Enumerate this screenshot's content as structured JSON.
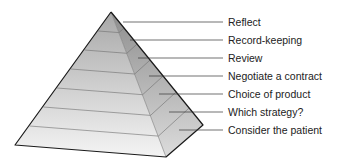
{
  "diagram": {
    "type": "pyramid",
    "title": "",
    "levels_top_to_bottom": [
      {
        "label": "Reflect"
      },
      {
        "label": "Record-keeping"
      },
      {
        "label": "Review"
      },
      {
        "label": "Negotiate a contract"
      },
      {
        "label": "Choice of product"
      },
      {
        "label": "Which strategy?"
      },
      {
        "label": "Consider the patient"
      }
    ]
  }
}
